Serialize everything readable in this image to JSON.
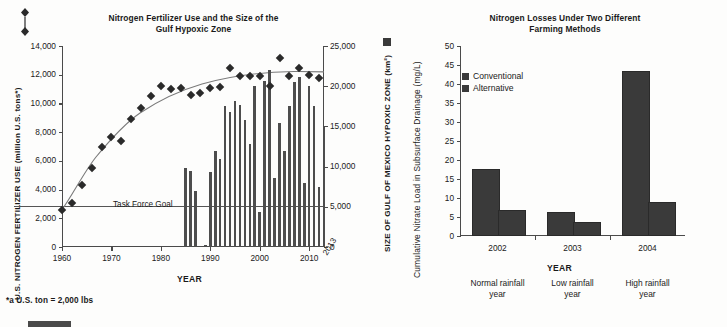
{
  "figure": {
    "footnote": "*a U.S. ton = 2,000 lbs"
  },
  "left": {
    "title_line1": "Nitrogen Fertilizer Use and the Size of the",
    "title_line2": "Gulf  Hypoxic Zone",
    "y_left_label": "U.S. NITROGEN FERTILIZER USE (million U.S. tons*)",
    "y_right_label": "SIZE OF GULF OF MEXICO HYPOXIC ZONE (km²)",
    "x_label": "YEAR",
    "task_force_goal_label": "Task Force Goal",
    "y_left_ticks": [
      "14,000",
      "12,000",
      "10,000",
      "8,000",
      "6,000",
      "4,000",
      "2,000",
      "0"
    ],
    "y_right_ticks": [
      "25,000",
      "20,000",
      "15,000",
      "10,000",
      "5,000",
      "0"
    ],
    "x_ticks": [
      "1960",
      "1970",
      "1980",
      "1990",
      "2000",
      "2010"
    ],
    "x_tick_end": "2013",
    "legend_marker_left": "diamond-marker",
    "legend_marker_right": "square-marker"
  },
  "right": {
    "title_line1": "Nitrogen Losses Under Two Different",
    "title_line2": "Farming Methods",
    "y_label": "Cumulative Nitrate Load in Subsurface Drainage (mg/L)",
    "x_label": "YEAR",
    "legend": [
      "Conventional",
      "Alternative"
    ],
    "y_ticks": [
      "50",
      "45",
      "40",
      "35",
      "30",
      "25",
      "20",
      "15",
      "10",
      "5",
      "0"
    ],
    "category_sublabels": [
      [
        "Normal rainfall",
        "year"
      ],
      [
        "Low rainfall",
        "year"
      ],
      [
        "High rainfall",
        "year"
      ]
    ]
  },
  "chart_data": [
    {
      "type": "line",
      "title": "Nitrogen Fertilizer Use and the Size of the Gulf  Hypoxic Zone",
      "xlabel": "YEAR",
      "ylabel": "U.S. NITROGEN FERTILIZER USE (million U.S. tons*)",
      "y2label": "SIZE OF GULF OF MEXICO HYPOXIC ZONE (km^2)",
      "xlim": [
        1960,
        2013
      ],
      "ylim": [
        0,
        14000
      ],
      "y2lim": [
        0,
        25000
      ],
      "grid": false,
      "annotations": [
        {
          "text": "Task Force Goal",
          "y2_value": 5000
        }
      ],
      "series": [
        {
          "name": "U.S. nitrogen fertilizer use (million U.S. tons)",
          "marker": "diamond",
          "axis": "left",
          "x": [
            1960,
            1962,
            1964,
            1966,
            1968,
            1970,
            1972,
            1974,
            1976,
            1978,
            1980,
            1982,
            1984,
            1986,
            1988,
            1990,
            1992,
            1994,
            1996,
            1998,
            2000,
            2002,
            2004,
            2006,
            2008,
            2010,
            2012
          ],
          "values": [
            2600,
            3100,
            4350,
            5500,
            6950,
            7650,
            7400,
            8900,
            9650,
            10550,
            11200,
            11000,
            11050,
            10600,
            10750,
            11050,
            11150,
            12500,
            11900,
            11900,
            11900,
            11200,
            13200,
            11900,
            12500,
            12000,
            11800
          ]
        },
        {
          "name": "Trend line (fertilizer use)",
          "type": "trend",
          "axis": "left",
          "x": [
            1960,
            1965,
            1970,
            1975,
            1980,
            1985,
            1990,
            1995,
            2000,
            2005,
            2010,
            2012
          ],
          "values": [
            2600,
            5000,
            7100,
            8800,
            10000,
            10900,
            11500,
            11950,
            12200,
            12300,
            12250,
            12150
          ]
        },
        {
          "name": "Size of Gulf of Mexico hypoxic zone (km^2)",
          "type": "bar",
          "axis": "right",
          "x": [
            1985,
            1986,
            1987,
            1988,
            1989,
            1990,
            1991,
            1992,
            1993,
            1994,
            1995,
            1996,
            1997,
            1998,
            1999,
            2000,
            2001,
            2002,
            2003,
            2004,
            2005,
            2006,
            2007,
            2008,
            2009,
            2010,
            2011,
            2012,
            2013
          ],
          "values": [
            9800,
            9500,
            7000,
            150,
            200,
            9300,
            12000,
            10900,
            17600,
            16800,
            18200,
            17700,
            15800,
            12800,
            20000,
            4400,
            20700,
            22000,
            8600,
            15400,
            11900,
            17500,
            20500,
            21200,
            8000,
            20000,
            17500,
            7500,
            15000
          ]
        }
      ]
    },
    {
      "type": "bar",
      "title": "Nitrogen Losses Under Two Different Farming Methods",
      "xlabel": "YEAR",
      "ylabel": "Cumulative Nitrate Load in Subsurface Drainage (mg/L)",
      "categories": [
        "2002",
        "2003",
        "2004"
      ],
      "ylim": [
        0,
        50
      ],
      "grid": false,
      "series": [
        {
          "name": "Conventional",
          "values": [
            17.2,
            5.9,
            43.0
          ],
          "color": "#3a3a3a"
        },
        {
          "name": "Alternative",
          "values": [
            6.4,
            3.1,
            8.5
          ],
          "color": "#3a3a3a"
        }
      ]
    }
  ]
}
